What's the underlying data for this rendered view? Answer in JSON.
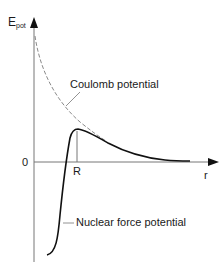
{
  "diagram": {
    "y_axis": {
      "label_main": "E",
      "label_sub": "pot"
    },
    "x_axis": {
      "label": "r"
    },
    "zero_label": "0",
    "r_marker_label": "R",
    "curves": [
      {
        "name": "Coulomb potential",
        "style": "dashed",
        "color": "#888888"
      },
      {
        "name": "Nuclear force potential",
        "style": "solid",
        "color": "#111111"
      }
    ],
    "labels": {
      "coulomb": "Coulomb potential",
      "nuclear": "Nuclear force potential"
    }
  }
}
